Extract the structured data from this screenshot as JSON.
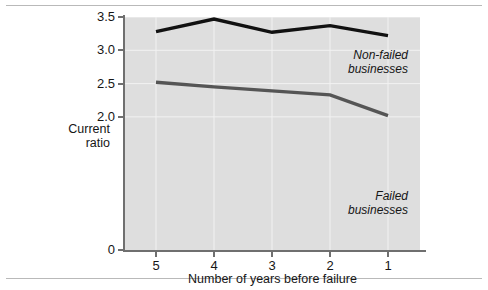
{
  "chart_data": {
    "type": "line",
    "title": "",
    "xlabel": "Number of years before failure",
    "ylabel": "Current ratio",
    "categories": [
      "5",
      "4",
      "3",
      "2",
      "1"
    ],
    "x_tick_labels": [
      "5",
      "4",
      "3",
      "2",
      "1"
    ],
    "y_tick_labels": [
      "0",
      "2.0",
      "2.5",
      "3.0",
      "3.5"
    ],
    "ylim": [
      0,
      3.5
    ],
    "y_ticks": [
      0,
      2.0,
      2.5,
      3.0,
      3.5
    ],
    "grid": true,
    "legend_position": "inline-annotation",
    "plot_background": "#dedede",
    "gridline_color": "#f2f2f2",
    "series": [
      {
        "name": "Non-failed businesses",
        "color": "#111111",
        "values": [
          3.28,
          3.47,
          3.27,
          3.37,
          3.22
        ]
      },
      {
        "name": "Failed businesses",
        "color": "#555555",
        "values": [
          2.52,
          2.45,
          2.39,
          2.33,
          2.02
        ]
      }
    ],
    "annotations": [
      {
        "name": "Non-failed businesses",
        "lines": [
          "Non-failed",
          "businesses"
        ]
      },
      {
        "name": "Failed businesses",
        "lines": [
          "Failed",
          "businesses"
        ]
      }
    ]
  },
  "axis": {
    "y_title_line1": "Current",
    "y_title_line2": "ratio",
    "x_title": "Number of years before failure"
  },
  "y_tick_labels": {
    "t0": "0",
    "t1": "2.0",
    "t2": "2.5",
    "t3": "3.0",
    "t4": "3.5"
  },
  "x_tick_labels": {
    "t0": "5",
    "t1": "4",
    "t2": "3",
    "t3": "2",
    "t4": "1"
  },
  "annotations": {
    "nonfailed_line1": "Non-failed",
    "nonfailed_line2": "businesses",
    "failed_line1": "Failed",
    "failed_line2": "businesses"
  }
}
